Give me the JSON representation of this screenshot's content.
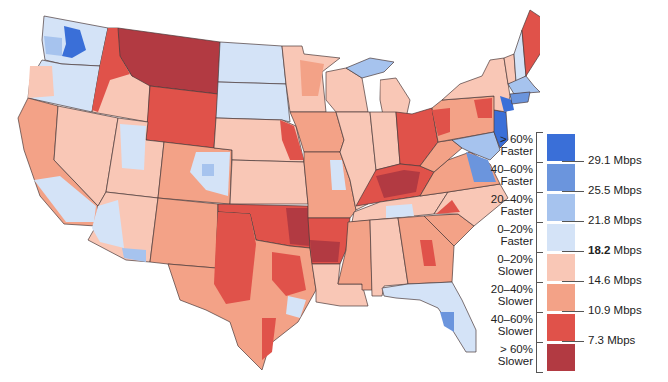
{
  "map": {
    "subject": "U.S. internet download speed by region relative to national baseline",
    "baseline": "18.2 Mbps",
    "colors": {
      "faster_60_plus": "#3a6fd8",
      "faster_40_60": "#6b95dd",
      "faster_20_40": "#a6c3ee",
      "faster_0_20": "#d4e3f7",
      "slower_0_20": "#f9c7b6",
      "slower_20_40": "#f3a287",
      "slower_40_60": "#e0524a",
      "slower_60_plus": "#b23a42"
    }
  },
  "legend": {
    "bins": [
      {
        "label_line1": "> 60%",
        "label_line2": "Faster",
        "color": "#3a6fd8"
      },
      {
        "label_line1": "40–60%",
        "label_line2": "Faster",
        "color": "#6b95dd"
      },
      {
        "label_line1": "20–40%",
        "label_line2": "Faster",
        "color": "#a6c3ee"
      },
      {
        "label_line1": "0–20%",
        "label_line2": "Faster",
        "color": "#d4e3f7"
      },
      {
        "label_line1": "0–20%",
        "label_line2": "Slower",
        "color": "#f9c7b6"
      },
      {
        "label_line1": "20–40%",
        "label_line2": "Slower",
        "color": "#f3a287"
      },
      {
        "label_line1": "40–60%",
        "label_line2": "Slower",
        "color": "#e0524a"
      },
      {
        "label_line1": "> 60%",
        "label_line2": "Slower",
        "color": "#b23a42"
      }
    ],
    "thresholds": [
      {
        "value": "29.1",
        "unit": " Mbps",
        "bold": false
      },
      {
        "value": "25.5",
        "unit": " Mbps",
        "bold": false
      },
      {
        "value": "21.8",
        "unit": " Mbps",
        "bold": false
      },
      {
        "value": "18.2",
        "unit": " Mbps",
        "bold": true
      },
      {
        "value": "14.6",
        "unit": " Mbps",
        "bold": false
      },
      {
        "value": "10.9",
        "unit": " Mbps",
        "bold": false
      },
      {
        "value": "7.3",
        "unit": " Mbps",
        "bold": false
      }
    ]
  }
}
